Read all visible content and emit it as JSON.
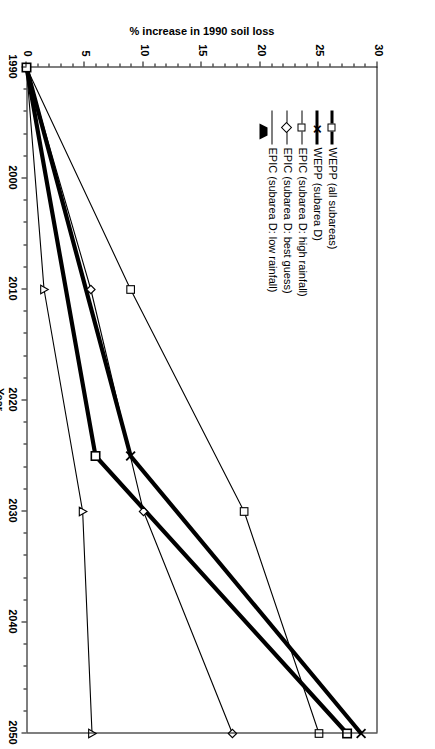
{
  "chart_data": {
    "type": "line",
    "title": "",
    "xlabel": "Year",
    "ylabel": "% increase in 1990 soil loss",
    "x": [
      1990,
      2000,
      2010,
      2020,
      2025,
      2030,
      2040,
      2050
    ],
    "xticks": [
      "1990",
      "2000",
      "2010",
      "2020",
      "2030",
      "2040",
      "2050"
    ],
    "yticks": [
      "0",
      "5",
      "10",
      "15",
      "20",
      "25",
      "30"
    ],
    "xlim": [
      1990,
      2050
    ],
    "ylim": [
      0,
      30
    ],
    "grid": false,
    "legend_position": "inside-left",
    "rotation_note": "figure printed rotated 90 degrees",
    "series": [
      {
        "name": "WEPP (all subareas)",
        "marker": "square",
        "line_width": "bold",
        "points": [
          {
            "x": 1990,
            "y": 0
          },
          {
            "x": 2025,
            "y": 5.9
          },
          {
            "x": 2050,
            "y": 27.4
          }
        ]
      },
      {
        "name": "WEPP (subarea D)",
        "marker": "x",
        "line_width": "bold",
        "points": [
          {
            "x": 1990,
            "y": 0
          },
          {
            "x": 2025,
            "y": 8.9
          },
          {
            "x": 2050,
            "y": 28.6
          }
        ]
      },
      {
        "name": "EPIC (subarea D: high rainfall)",
        "marker": "square",
        "line_width": "thin",
        "points": [
          {
            "x": 1990,
            "y": 0
          },
          {
            "x": 2010,
            "y": 8.9
          },
          {
            "x": 2030,
            "y": 18.6
          },
          {
            "x": 2050,
            "y": 25.0
          }
        ]
      },
      {
        "name": "EPIC (subarea D: best guess)",
        "marker": "diamond",
        "line_width": "thin",
        "points": [
          {
            "x": 1990,
            "y": 0
          },
          {
            "x": 2010,
            "y": 5.5
          },
          {
            "x": 2030,
            "y": 10.0
          },
          {
            "x": 2050,
            "y": 17.6
          }
        ]
      },
      {
        "name": "EPIC (subarea D: low rainfall)",
        "marker": "triangle",
        "line_width": "thin",
        "points": [
          {
            "x": 1990,
            "y": 0
          },
          {
            "x": 2010,
            "y": 1.5
          },
          {
            "x": 2030,
            "y": 4.8
          },
          {
            "x": 2050,
            "y": 5.6
          }
        ]
      }
    ]
  },
  "axes": {
    "x_title": "Year",
    "y_title": "% increase in 1990 soil loss",
    "x_labels": [
      "1990",
      "2000",
      "2010",
      "2020",
      "2030",
      "2040",
      "2050"
    ],
    "y_labels": [
      "0",
      "5",
      "10",
      "15",
      "20",
      "25",
      "30"
    ]
  },
  "legend": {
    "items": [
      {
        "label": "WEPP (all subareas)"
      },
      {
        "label": "WEPP (subarea D)"
      },
      {
        "label": "EPIC (subarea D: high rainfall)"
      },
      {
        "label": "EPIC (subarea D: best guess)"
      },
      {
        "label": "EPIC (subarea D: low rainfall)"
      }
    ]
  },
  "colors": {
    "line": "#000000",
    "axis": "#000000",
    "background": "#ffffff"
  }
}
